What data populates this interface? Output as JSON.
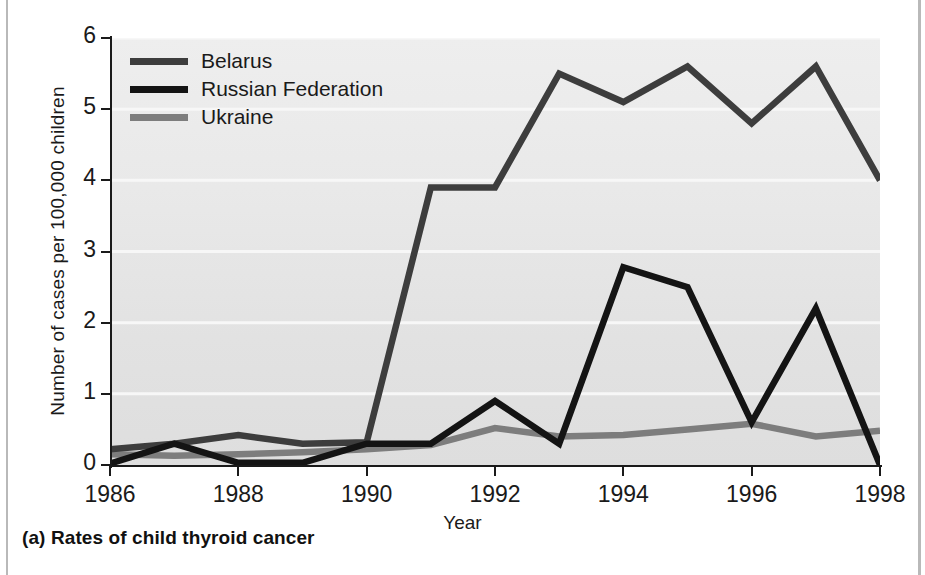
{
  "figure": {
    "caption": "(a) Rates of child thyroid cancer"
  },
  "chart_data": {
    "type": "line",
    "title": "",
    "xlabel": "Year",
    "ylabel": "Number of cases per 100,000 children",
    "xlim": [
      1986,
      1998
    ],
    "ylim": [
      0,
      6
    ],
    "x": [
      1986,
      1987,
      1988,
      1989,
      1990,
      1991,
      1992,
      1993,
      1994,
      1995,
      1996,
      1997,
      1998
    ],
    "xticks": [
      1986,
      1988,
      1990,
      1992,
      1994,
      1996,
      1998
    ],
    "xtick_labels": [
      "1986",
      "1988",
      "1990",
      "1992",
      "1994",
      "1996",
      "1998"
    ],
    "yticks": [
      0,
      1,
      2,
      3,
      4,
      5,
      6
    ],
    "ytick_labels": [
      "0",
      "1",
      "2",
      "3",
      "4",
      "5",
      "6"
    ],
    "grid": "horizontal-white",
    "legend_position": "top-left",
    "plot_background": "#e7e7e7",
    "series": [
      {
        "name": "Belarus",
        "color": "#3d3d3d",
        "values": [
          0.22,
          0.3,
          0.42,
          0.3,
          0.32,
          3.9,
          3.9,
          5.5,
          5.1,
          5.6,
          4.8,
          5.6,
          4.0
        ]
      },
      {
        "name": "Russian Federation",
        "color": "#141414",
        "values": [
          0.02,
          0.3,
          0.03,
          0.03,
          0.3,
          0.3,
          0.9,
          0.3,
          2.78,
          2.5,
          0.6,
          2.2,
          0.0
        ]
      },
      {
        "name": "Ukraine",
        "color": "#7d7d7d",
        "values": [
          0.15,
          0.13,
          0.15,
          0.18,
          0.22,
          0.28,
          0.52,
          0.4,
          0.42,
          0.5,
          0.58,
          0.4,
          0.48
        ]
      }
    ]
  }
}
